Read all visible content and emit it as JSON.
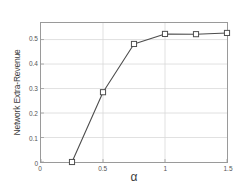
{
  "chart_data": {
    "type": "line",
    "title": "",
    "xlabel": "α",
    "ylabel": "Network Extra-Revenue",
    "xlim": [
      0,
      1.5
    ],
    "ylim": [
      0,
      0.5676
    ],
    "xticks": [
      0,
      0.5,
      1,
      1.5
    ],
    "xticklabels": [
      "0",
      "0.5",
      "1",
      "1.5"
    ],
    "yticks": [
      0,
      0.1,
      0.2,
      0.3,
      0.4,
      0.5
    ],
    "yticklabels": [
      "0",
      "0.1",
      "0.2",
      "0.3",
      "0.4",
      "0.5"
    ],
    "grid": true,
    "legend": null,
    "series": [
      {
        "name": "Network Extra-Revenue",
        "marker": "square-open",
        "line_color": "#4d4d4d",
        "marker_color": "#4d4d4d",
        "x": [
          0.25,
          0.5,
          0.75,
          1.0,
          1.25,
          1.5
        ],
        "values": [
          0.0,
          0.285,
          0.482,
          0.523,
          0.522,
          0.527
        ]
      }
    ]
  },
  "colors": {
    "background": "#ffffff",
    "axis": "#9a9a9a",
    "grid": "#d9d9d9",
    "line": "#4d4d4d",
    "text": "#4a4a4a"
  }
}
